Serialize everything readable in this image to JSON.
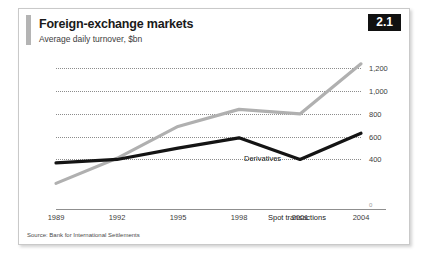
{
  "figure": {
    "badge": "2.1",
    "title": "Foreign-exchange markets",
    "subtitle": "Average daily turnover, $bn",
    "source": "Source: Bank for International Settlements"
  },
  "chart_data": {
    "type": "line",
    "title": "Foreign-exchange markets",
    "subtitle": "Average daily turnover, $bn",
    "xlabel": "",
    "ylabel": "$bn",
    "categories": [
      "1989",
      "1992",
      "1995",
      "1998",
      "2001",
      "2004"
    ],
    "x": [
      1989,
      1992,
      1995,
      1998,
      2001,
      2004
    ],
    "series": [
      {
        "name": "Derivatives",
        "color": "#b0b0b0",
        "values": [
          190,
          410,
          690,
          840,
          800,
          1240
        ]
      },
      {
        "name": "Spot transactions",
        "color": "#141414",
        "values": [
          370,
          400,
          500,
          590,
          400,
          630
        ]
      }
    ],
    "ylim": [
      0,
      1300
    ],
    "yticks": [
      0,
      400,
      600,
      800,
      1000,
      1200
    ],
    "ytick_labels": [
      "0",
      "400",
      "600",
      "800",
      "1,000",
      "1,200"
    ],
    "grid": true,
    "grid_style": "dotted",
    "legend": "inline-labels",
    "annotations": [
      "Derivatives",
      "Spot transactions"
    ],
    "source": "Source: Bank for International Settlements"
  }
}
